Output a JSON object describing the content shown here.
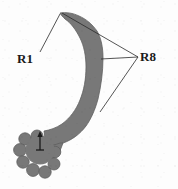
{
  "figure": {
    "type": "turbine-blade-section-diagram",
    "background_color": "#fdfdfd",
    "blade": {
      "name": "turbine-blade",
      "fill_color": "#787878",
      "outline_color": "#5a5a5a",
      "root_name": "fir-tree-root",
      "tip_point": [
        60,
        13
      ]
    },
    "axis_indicator": {
      "name": "orientation-arrow",
      "color": "#1a1a1a",
      "origin": [
        40,
        149
      ],
      "tip": [
        40,
        133
      ]
    },
    "annotations": [
      {
        "id": "r1",
        "label": "R1",
        "label_x": 17,
        "label_y": 52,
        "leader_lines": [
          {
            "from": [
              40,
              52
            ],
            "to": [
              60,
              14
            ]
          }
        ]
      },
      {
        "id": "r8",
        "label": "R8",
        "label_x": 140,
        "label_y": 50,
        "leader_lines": [
          {
            "from": [
              138,
              57
            ],
            "to": [
              62,
              13
            ]
          },
          {
            "from": [
              138,
              57
            ],
            "to": [
              101,
              59
            ]
          },
          {
            "from": [
              138,
              57
            ],
            "to": [
              100,
              112
            ]
          }
        ]
      }
    ]
  }
}
